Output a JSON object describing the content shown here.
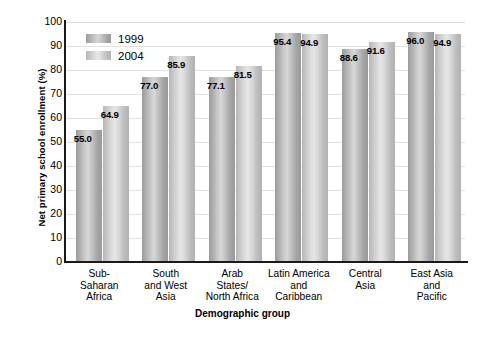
{
  "chart_data": {
    "type": "bar",
    "title": "",
    "xlabel": "Demographic group",
    "ylabel": "Net primary school enrollment (%)",
    "ylim": [
      0,
      100
    ],
    "ytick_step": 10,
    "yticks": [
      "100",
      "90",
      "80",
      "70",
      "60",
      "50",
      "40",
      "30",
      "20",
      "10",
      "0"
    ],
    "grid": true,
    "legend_position": "top-left inside plot",
    "categories": [
      "Sub-Saharan Africa",
      "South and West Asia",
      "Arab States/North Africa",
      "Latin America and Caribbean",
      "Central Asia",
      "East Asia and Pacific"
    ],
    "category_lines": [
      [
        "Sub-",
        "Saharan",
        "Africa"
      ],
      [
        "South",
        "and West",
        "Asia"
      ],
      [
        "Arab",
        "States/",
        "North Africa"
      ],
      [
        "Latin America",
        "and",
        "Caribbean"
      ],
      [
        "Central",
        "Asia"
      ],
      [
        "East Asia",
        "and",
        "Pacific"
      ]
    ],
    "series": [
      {
        "name": "1999",
        "color": "#b0b0b0",
        "values": [
          55.0,
          77.0,
          77.1,
          95.4,
          88.6,
          96.0
        ],
        "labels": [
          "55.0",
          "77.0",
          "77.1",
          "95.4",
          "88.6",
          "96.0"
        ]
      },
      {
        "name": "2004",
        "color": "#d2d2d2",
        "values": [
          64.9,
          85.9,
          81.5,
          94.9,
          91.6,
          94.9
        ],
        "labels": [
          "64.9",
          "85.9",
          "81.5",
          "94.9",
          "91.6",
          "94.9"
        ]
      }
    ]
  },
  "legend": {
    "items": [
      {
        "label": "1999"
      },
      {
        "label": "2004"
      }
    ]
  }
}
